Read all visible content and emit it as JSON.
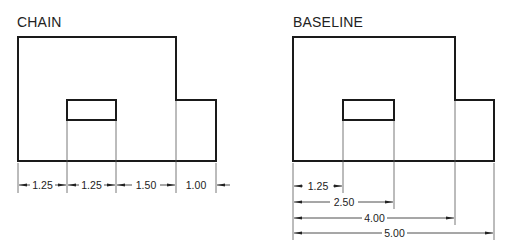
{
  "diagrams": [
    {
      "title": "CHAIN",
      "dimensions": [
        "1.25",
        "1.25",
        "1.50",
        "1.00"
      ]
    },
    {
      "title": "BASELINE",
      "dimensions": [
        "1.25",
        "2.50",
        "4.00",
        "5.00"
      ]
    }
  ],
  "colors": {
    "outline": "#1a1a1a",
    "dimension_line": "#333333",
    "background": "#ffffff"
  }
}
